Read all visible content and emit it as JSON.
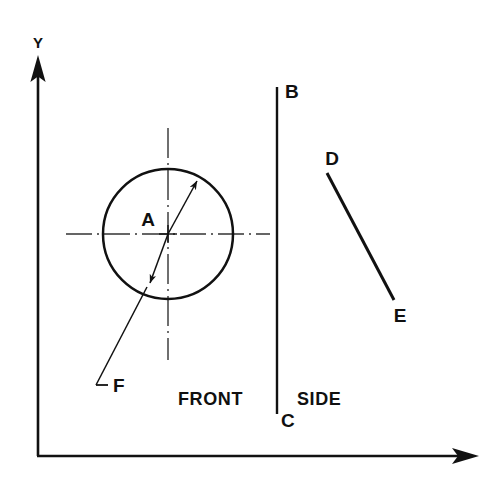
{
  "figure": {
    "type": "engineering-orthographic-projection",
    "background_color": "#ffffff",
    "line_color": "#111111",
    "centerline_color": "#333333",
    "width": 484,
    "height": 483
  },
  "axes": {
    "y_label": "Y",
    "x_label": "",
    "origin": {
      "x": 38,
      "y": 456
    },
    "y_tip": {
      "x": 38,
      "y": 58
    },
    "x_tip": {
      "x": 478,
      "y": 456
    },
    "y_arrow_name": "y-axis-arrow",
    "x_arrow_name": "x-axis-arrow"
  },
  "views": {
    "front": {
      "label": "FRONT",
      "label_pos": {
        "x": 178,
        "y": 400
      }
    },
    "side": {
      "label": "SIDE",
      "label_pos": {
        "x": 297,
        "y": 400
      }
    }
  },
  "front_view": {
    "circle": {
      "center": {
        "x": 168,
        "y": 234
      },
      "radius": 65
    },
    "center_mark_label": "A",
    "center_mark_label_pos": {
      "x": 148,
      "y": 225
    },
    "horizontal_centerline": {
      "x1": 66,
      "y1": 234,
      "x2": 270,
      "y2": 234
    },
    "vertical_centerline": {
      "x1": 168,
      "y1": 128,
      "x2": 168,
      "y2": 360
    },
    "diameter_dimension": {
      "label": "F",
      "label_pos": {
        "x": 111,
        "y": 397
      },
      "arrow_tip_upper": {
        "x": 200,
        "y": 177
      },
      "arrow_tip_lower": {
        "x": 147,
        "y": 287
      },
      "leader_elbow": {
        "x": 96,
        "y": 385
      },
      "leader_foot": {
        "x": 107,
        "y": 385
      }
    }
  },
  "side_view": {
    "divider_line": {
      "label_top": "B",
      "label_bottom": "C",
      "top": {
        "x": 277,
        "y": 87
      },
      "bottom": {
        "x": 277,
        "y": 414
      },
      "label_top_pos": {
        "x": 285,
        "y": 97
      },
      "label_bottom_pos": {
        "x": 283,
        "y": 425
      }
    },
    "edge_line": {
      "label_start": "D",
      "label_end": "E",
      "start": {
        "x": 327,
        "y": 173
      },
      "end": {
        "x": 394,
        "y": 300
      },
      "label_start_pos": {
        "x": 331,
        "y": 164
      },
      "label_end_pos": {
        "x": 397,
        "y": 321
      }
    }
  },
  "callouts": [
    {
      "id": "A",
      "meaning": "circle-center-mark"
    },
    {
      "id": "B",
      "meaning": "divider-top"
    },
    {
      "id": "C",
      "meaning": "divider-bottom"
    },
    {
      "id": "D",
      "meaning": "edge-line-top"
    },
    {
      "id": "E",
      "meaning": "edge-line-bottom"
    },
    {
      "id": "F",
      "meaning": "diameter-dimension"
    },
    {
      "id": "Y",
      "meaning": "vertical-axis"
    }
  ]
}
